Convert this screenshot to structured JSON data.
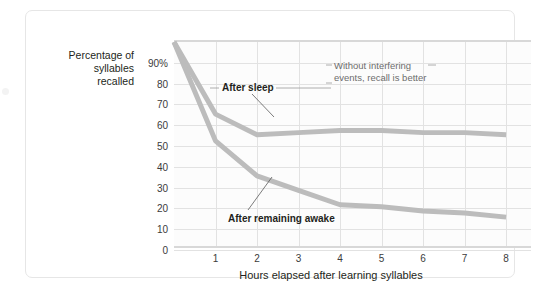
{
  "figure": {
    "y_axis_title": "Percentage of\nsyllables\nrecalled",
    "x_axis_title": "Hours elapsed after learning syllables",
    "annotations": {
      "after_sleep": "After sleep",
      "after_awake": "After remaining awake",
      "without_interfering": "Without interfering events, recall is better"
    }
  },
  "chart_data": {
    "type": "line",
    "title": "",
    "xlabel": "Hours elapsed after learning syllables",
    "ylabel": "Percentage of syllables recalled",
    "xlim": [
      0,
      8.6
    ],
    "ylim": [
      0,
      100
    ],
    "xticks": [
      1,
      2,
      3,
      4,
      5,
      6,
      7,
      8
    ],
    "xtick_labels": [
      "1",
      "2",
      "3",
      "4",
      "5",
      "6",
      "7",
      "8"
    ],
    "yticks": [
      0,
      10,
      20,
      30,
      40,
      50,
      60,
      70,
      80,
      90
    ],
    "ytick_labels": [
      "0",
      "10",
      "20",
      "30",
      "40",
      "50",
      "60",
      "70",
      "80",
      "90%"
    ],
    "grid": true,
    "legend": "none",
    "series": [
      {
        "name": "After sleep",
        "color": "#bcbcbc",
        "x": [
          0,
          1,
          2,
          3,
          4,
          5,
          6,
          7,
          8
        ],
        "values": [
          100,
          65,
          55,
          56,
          57,
          57,
          56,
          56,
          55
        ]
      },
      {
        "name": "After remaining awake",
        "color": "#bcbcbc",
        "x": [
          0,
          1,
          2,
          3,
          4,
          5,
          6,
          7,
          8
        ],
        "values": [
          100,
          52,
          35,
          28,
          21,
          20,
          18,
          17,
          15
        ]
      }
    ],
    "annotations": [
      {
        "text": "After sleep",
        "points_to_series": "After sleep",
        "at_x": 3.4
      },
      {
        "text": "After remaining awake",
        "points_to_series": "After remaining awake",
        "at_x": 3.6
      },
      {
        "text": "Without interfering events, recall is better",
        "points_to_series": "After sleep",
        "at_x": 5.2
      }
    ]
  }
}
